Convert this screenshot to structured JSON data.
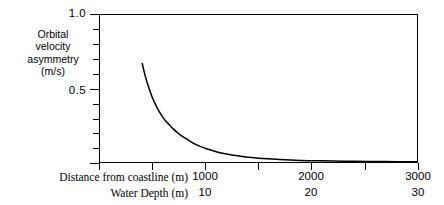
{
  "figure": {
    "y_axis_title_lines": [
      "Orbital",
      "velocity",
      "asymmetry",
      "(m/s)"
    ],
    "y_axis_title": "Orbital velocity asymmetry (m/s)",
    "row_labels": {
      "distance": "Distance from coastline (m)",
      "depth": "Water Depth (m)"
    },
    "y_tick_labels": {
      "top": "1.0",
      "mid": "0.5"
    },
    "x_tick_labels_distance": [
      "1000",
      "2000",
      "3000"
    ],
    "x_tick_labels_depth": [
      "10",
      "20",
      "30"
    ],
    "colors": {
      "line": "#000000",
      "axis": "#000000",
      "background": "#ffffff"
    }
  },
  "chart_data": {
    "type": "line",
    "title": "",
    "xlabel": "Distance from coastline (m)",
    "ylabel": "Orbital velocity asymmetry (m/s)",
    "secondary_xlabel": "Water Depth (m)",
    "xlim": [
      0,
      3000
    ],
    "ylim": [
      0,
      1.0
    ],
    "grid": false,
    "legend": "none",
    "x_ticks": [
      0,
      500,
      1000,
      1500,
      2000,
      2500,
      3000
    ],
    "x_tick_labels": [
      "",
      "",
      "1000",
      "",
      "2000",
      "",
      "3000"
    ],
    "secondary_x_ticks": [
      0,
      5,
      10,
      15,
      20,
      25,
      30
    ],
    "secondary_x_tick_labels": [
      "",
      "",
      "10",
      "",
      "20",
      "",
      "30"
    ],
    "y_ticks": [
      0,
      0.1,
      0.2,
      0.3,
      0.4,
      0.5,
      0.6,
      0.7,
      0.8,
      0.9,
      1.0
    ],
    "y_tick_labels": [
      "",
      "",
      "",
      "",
      "",
      "0.5",
      "",
      "",
      "",
      "",
      "1.0"
    ],
    "series": [
      {
        "name": "Orbital velocity asymmetry",
        "x": [
          400,
          430,
          460,
          500,
          540,
          580,
          620,
          660,
          700,
          750,
          800,
          850,
          900,
          950,
          1000,
          1100,
          1200,
          1300,
          1400,
          1500,
          1700,
          1900,
          2100,
          2400,
          2700,
          3000
        ],
        "y": [
          0.67,
          0.58,
          0.51,
          0.43,
          0.37,
          0.32,
          0.28,
          0.25,
          0.22,
          0.19,
          0.165,
          0.142,
          0.122,
          0.106,
          0.092,
          0.07,
          0.054,
          0.042,
          0.033,
          0.026,
          0.017,
          0.011,
          0.008,
          0.005,
          0.003,
          0.002
        ]
      }
    ]
  }
}
